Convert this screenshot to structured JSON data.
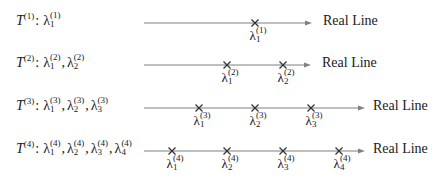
{
  "diagram": {
    "axis_label": "Real Line",
    "line_color": "#808080",
    "mark_color": "#333333",
    "rows": [
      {
        "matrix": "T",
        "index": "(1)",
        "y": 23,
        "line_start": 144,
        "arrow_end": 312,
        "label_x": 323,
        "eigen_labels": [
          "λ",
          "λ"
        ],
        "eigenvalues": [
          {
            "symbol": "λ",
            "sub": "1",
            "sup": "(1)",
            "x": 255
          }
        ]
      },
      {
        "matrix": "T",
        "index": "(2)",
        "y": 65,
        "line_start": 144,
        "arrow_end": 311,
        "label_x": 322,
        "eigenvalues": [
          {
            "symbol": "λ",
            "sub": "1",
            "sup": "(2)",
            "x": 227
          },
          {
            "symbol": "λ",
            "sub": "2",
            "sup": "(2)",
            "x": 283
          }
        ]
      },
      {
        "matrix": "T",
        "index": "(3)",
        "y": 108,
        "line_start": 144,
        "arrow_end": 365,
        "label_x": 373,
        "eigenvalues": [
          {
            "symbol": "λ",
            "sub": "1",
            "sup": "(3)",
            "x": 199
          },
          {
            "symbol": "λ",
            "sub": "2",
            "sup": "(3)",
            "x": 255
          },
          {
            "symbol": "λ",
            "sub": "3",
            "sup": "(3)",
            "x": 311
          }
        ]
      },
      {
        "matrix": "T",
        "index": "(4)",
        "y": 151,
        "line_start": 144,
        "arrow_end": 365,
        "label_x": 373,
        "eigenvalues": [
          {
            "symbol": "λ",
            "sub": "1",
            "sup": "(4)",
            "x": 172
          },
          {
            "symbol": "λ",
            "sub": "2",
            "sup": "(4)",
            "x": 227
          },
          {
            "symbol": "λ",
            "sub": "3",
            "sup": "(4)",
            "x": 283
          },
          {
            "symbol": "λ",
            "sub": "4",
            "sup": "(4)",
            "x": 339
          }
        ]
      }
    ]
  }
}
